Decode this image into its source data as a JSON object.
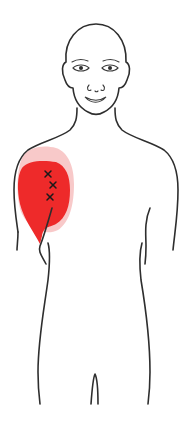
{
  "figure": {
    "view": "anterior",
    "pain_region": {
      "location": "right shoulder (front deltoid)",
      "primary_color": "#ee2a2a",
      "halo_color": "#f6b7b7"
    },
    "trigger_points": [
      {
        "label": "x",
        "x": 48,
        "y": 174
      },
      {
        "label": "x",
        "x": 53,
        "y": 185
      },
      {
        "label": "x",
        "x": 50,
        "y": 197
      }
    ]
  }
}
